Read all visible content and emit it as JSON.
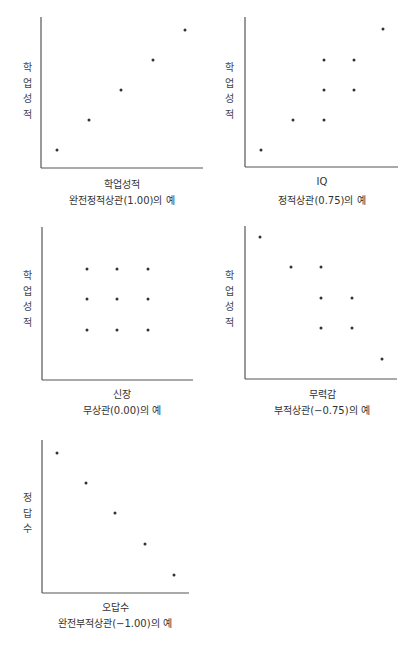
{
  "chart_data": [
    {
      "type": "scatter",
      "id": "perfect-positive",
      "xlabel": "학업성적",
      "ylabel": "학업성적",
      "ylabel_chars": [
        "학",
        "업",
        "성",
        "적"
      ],
      "caption": "완전정적상관(1.00)의 예",
      "correlation": 1.0,
      "grid": false,
      "axis_px": {
        "x0": 41,
        "y_top": 17,
        "y_bottom": 168,
        "x_end": 203
      },
      "points": [
        [
          1,
          1
        ],
        [
          2,
          2
        ],
        [
          3,
          3
        ],
        [
          4,
          4
        ],
        [
          5,
          5
        ]
      ],
      "points_px": [
        [
          57,
          150
        ],
        [
          89,
          120
        ],
        [
          121,
          90
        ],
        [
          153,
          60
        ],
        [
          185,
          30
        ]
      ]
    },
    {
      "type": "scatter",
      "id": "positive",
      "xlabel": "IQ",
      "ylabel": "학업성적",
      "ylabel_chars": [
        "학",
        "업",
        "성",
        "적"
      ],
      "caption": "정적상관(0.75)의 예",
      "correlation": 0.75,
      "grid": false,
      "axis_px": {
        "x0": 245,
        "y_top": 17,
        "y_bottom": 167,
        "x_end": 398
      },
      "points": [
        [
          1,
          1
        ],
        [
          2,
          2
        ],
        [
          3,
          2
        ],
        [
          3,
          3
        ],
        [
          4,
          3
        ],
        [
          3,
          4
        ],
        [
          4,
          4
        ],
        [
          5,
          5
        ]
      ],
      "points_px": [
        [
          261,
          150
        ],
        [
          293,
          120
        ],
        [
          324,
          120
        ],
        [
          324,
          90
        ],
        [
          354,
          90
        ],
        [
          324,
          60
        ],
        [
          354,
          60
        ],
        [
          383,
          29
        ]
      ]
    },
    {
      "type": "scatter",
      "id": "no-correlation",
      "xlabel": "신장",
      "ylabel": "학업성적",
      "ylabel_chars": [
        "학",
        "업",
        "성",
        "적"
      ],
      "caption": "무상관(0.00)의 예",
      "correlation": 0.0,
      "grid": false,
      "axis_px": {
        "x0": 42,
        "y_top": 227,
        "y_bottom": 380,
        "x_end": 193
      },
      "points": [
        [
          1,
          1
        ],
        [
          2,
          1
        ],
        [
          3,
          1
        ],
        [
          1,
          2
        ],
        [
          2,
          2
        ],
        [
          3,
          2
        ],
        [
          1,
          3
        ],
        [
          2,
          3
        ],
        [
          3,
          3
        ]
      ],
      "points_px": [
        [
          87,
          330
        ],
        [
          117,
          330
        ],
        [
          148,
          330
        ],
        [
          87,
          299
        ],
        [
          117,
          299
        ],
        [
          148,
          299
        ],
        [
          87,
          269
        ],
        [
          117,
          269
        ],
        [
          148,
          269
        ]
      ]
    },
    {
      "type": "scatter",
      "id": "negative",
      "xlabel": "무력감",
      "ylabel": "학업성적",
      "ylabel_chars": [
        "학",
        "업",
        "성",
        "적"
      ],
      "caption": "부적상관(−0.75)의 예",
      "correlation": -0.75,
      "grid": false,
      "axis_px": {
        "x0": 245,
        "y_top": 226,
        "y_bottom": 379,
        "x_end": 397
      },
      "points": [
        [
          1,
          5
        ],
        [
          2,
          4
        ],
        [
          3,
          4
        ],
        [
          3,
          3
        ],
        [
          4,
          3
        ],
        [
          3,
          2
        ],
        [
          4,
          2
        ],
        [
          5,
          1
        ]
      ],
      "points_px": [
        [
          260,
          237
        ],
        [
          291,
          267
        ],
        [
          321,
          267
        ],
        [
          321,
          298
        ],
        [
          352,
          298
        ],
        [
          321,
          328
        ],
        [
          352,
          328
        ],
        [
          382,
          359
        ]
      ]
    },
    {
      "type": "scatter",
      "id": "perfect-negative",
      "xlabel": "오답수",
      "ylabel": "정답수",
      "ylabel_chars": [
        "정",
        "답",
        "수"
      ],
      "caption": "완전부적상관(−1.00)의 예",
      "correlation": -1.0,
      "grid": false,
      "axis_px": {
        "x0": 42,
        "y_top": 440,
        "y_bottom": 593,
        "x_end": 189
      },
      "points": [
        [
          1,
          5
        ],
        [
          2,
          4
        ],
        [
          3,
          3
        ],
        [
          4,
          2
        ],
        [
          5,
          1
        ]
      ],
      "points_px": [
        [
          57,
          453
        ],
        [
          86,
          483
        ],
        [
          115,
          513
        ],
        [
          145,
          544
        ],
        [
          174,
          575
        ]
      ]
    }
  ],
  "colors": {
    "axis": "#555555",
    "point": "#333333",
    "text": "#333333"
  },
  "layout": [
    {
      "ylabel_x": 20,
      "ylabel_y": 60,
      "xlabel_cx": 122,
      "xlabel_y": 176,
      "caption_y": 192
    },
    {
      "ylabel_x": 222,
      "ylabel_y": 60,
      "xlabel_cx": 322,
      "xlabel_y": 176,
      "caption_y": 192
    },
    {
      "ylabel_x": 20,
      "ylabel_y": 268,
      "xlabel_cx": 122,
      "xlabel_y": 386,
      "caption_y": 402
    },
    {
      "ylabel_x": 222,
      "ylabel_y": 268,
      "xlabel_cx": 322,
      "xlabel_y": 386,
      "caption_y": 402
    },
    {
      "ylabel_x": 20,
      "ylabel_y": 490,
      "xlabel_cx": 115,
      "xlabel_y": 599,
      "caption_y": 615
    }
  ]
}
